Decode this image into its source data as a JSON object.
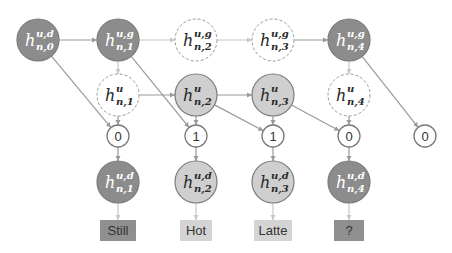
{
  "diagram": {
    "colors": {
      "dark_fill": "#8c8c8c",
      "light_fill": "#cfcfcf",
      "white_fill": "#ffffff",
      "stroke": "#7a7a7a",
      "dashed_stroke": "#9a9a9a",
      "edge": "#9a9a9a",
      "faint_edge": "#c8c8c8",
      "dark_text": "#ffffff",
      "light_text": "#2a2a2a"
    },
    "top_row": [
      {
        "id": "h_n0_ud",
        "base": "h",
        "sup": "u,d",
        "sub": "n,0",
        "style": "dark"
      },
      {
        "id": "h_n1_ug",
        "base": "h",
        "sup": "u,g",
        "sub": "n,1",
        "style": "dark"
      },
      {
        "id": "h_n2_ug",
        "base": "h",
        "sup": "u,g",
        "sub": "n,2",
        "style": "dashed"
      },
      {
        "id": "h_n3_ug",
        "base": "h",
        "sup": "u,g",
        "sub": "n,3",
        "style": "dashed"
      },
      {
        "id": "h_n4_ug",
        "base": "h",
        "sup": "u,g",
        "sub": "n,4",
        "style": "dark"
      }
    ],
    "mid_row": [
      {
        "id": "h_n1_u",
        "base": "h",
        "sup": "u",
        "sub": "n,1",
        "style": "dashed"
      },
      {
        "id": "h_n2_u",
        "base": "h",
        "sup": "u",
        "sub": "n,2",
        "style": "light"
      },
      {
        "id": "h_n3_u",
        "base": "h",
        "sup": "u",
        "sub": "n,3",
        "style": "light"
      },
      {
        "id": "h_n4_u",
        "base": "h",
        "sup": "u",
        "sub": "n,4",
        "style": "dashed"
      }
    ],
    "bit_row": [
      "0",
      "1",
      "1",
      "0",
      "0"
    ],
    "bottom_row": [
      {
        "id": "h_n1_ud",
        "base": "h",
        "sup": "u,d",
        "sub": "n,1",
        "style": "dark"
      },
      {
        "id": "h_n2_ud",
        "base": "h",
        "sup": "u,d",
        "sub": "n,2",
        "style": "light"
      },
      {
        "id": "h_n3_ud",
        "base": "h",
        "sup": "u,d",
        "sub": "n,3",
        "style": "light"
      },
      {
        "id": "h_n4_ud",
        "base": "h",
        "sup": "u,d",
        "sub": "n,4",
        "style": "dark"
      }
    ],
    "words": [
      {
        "text": "Still",
        "style": "dark"
      },
      {
        "text": "Hot",
        "style": "light"
      },
      {
        "text": "Latte",
        "style": "light"
      },
      {
        "text": "?",
        "style": "dark"
      }
    ]
  }
}
